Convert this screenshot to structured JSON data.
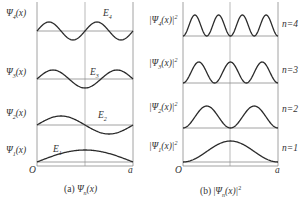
{
  "panel_a": {
    "caption": "(a) Ψn(x)",
    "caption_prefix": "(a) ",
    "caption_main": "Ψ",
    "caption_sub": "n",
    "caption_suffix": "(x)",
    "origin_label": "O",
    "end_label": "a",
    "rows": [
      {
        "label": "Ψ",
        "sub": "4",
        "arg": "(x)",
        "energy": "E",
        "energy_sub": "4",
        "n": 4
      },
      {
        "label": "Ψ",
        "sub": "3",
        "arg": "(x)",
        "energy": "E",
        "energy_sub": "3",
        "n": 3
      },
      {
        "label": "Ψ",
        "sub": "2",
        "arg": "(x)",
        "energy": "E",
        "energy_sub": "2",
        "n": 2
      },
      {
        "label": "Ψ",
        "sub": "1",
        "arg": "(x)",
        "energy": "E",
        "energy_sub": "1",
        "n": 1
      }
    ]
  },
  "panel_b": {
    "caption_prefix": "(b)  |",
    "caption_main": "Ψ",
    "caption_sub": "n",
    "caption_suffix": "(x)|",
    "caption_sup": "2",
    "origin_label": "O",
    "end_label": "a",
    "rows": [
      {
        "label_pre": "|Ψ",
        "sub": "4",
        "arg": "(x)|",
        "sup": "2",
        "n_label": "n=4",
        "n": 4
      },
      {
        "label_pre": "|Ψ",
        "sub": "3",
        "arg": "(x)|",
        "sup": "2",
        "n_label": "n=3",
        "n": 3
      },
      {
        "label_pre": "|Ψ",
        "sub": "2",
        "arg": "(x)|",
        "sup": "2",
        "n_label": "n=2",
        "n": 2
      },
      {
        "label_pre": "|Ψ",
        "sub": "1",
        "arg": "(x)|",
        "sup": "2",
        "n_label": "n=1",
        "n": 1
      }
    ]
  },
  "colors": {
    "curve": "#2b2b2b",
    "axis": "#8a8a8a"
  }
}
